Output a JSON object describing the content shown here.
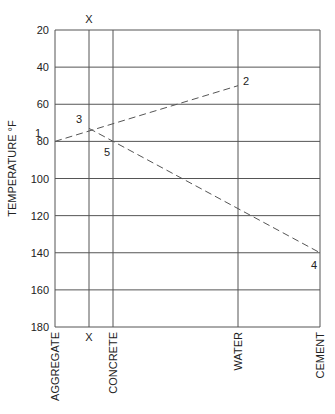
{
  "chart_data": {
    "type": "line",
    "title": "",
    "ylabel": "TEMPERATURE °F",
    "xlabel": "",
    "ylim": [
      20,
      180
    ],
    "y_inverted": true,
    "y_ticks": [
      20,
      40,
      60,
      80,
      100,
      120,
      140,
      160,
      180
    ],
    "x_positions": [
      {
        "label": "AGGREGATE",
        "x": 55
      },
      {
        "label": "X",
        "x": 89
      },
      {
        "label": "CONCRETE",
        "x": 113
      },
      {
        "label": "WATER",
        "x": 238
      },
      {
        "label": "CEMENT",
        "x": 320
      }
    ],
    "top_label": "X",
    "grid": true,
    "points": [
      {
        "id": "1",
        "at": "AGGREGATE",
        "temp": 80
      },
      {
        "id": "2",
        "at": "WATER",
        "temp": 50
      },
      {
        "id": "3",
        "at": "X",
        "temp": 73
      },
      {
        "id": "4",
        "at": "CEMENT",
        "temp": 140
      },
      {
        "id": "5",
        "at": "CONCRETE",
        "temp": 80
      }
    ],
    "series": [
      {
        "name": "line 1-2",
        "style": "dashed",
        "from": "1",
        "to": "2",
        "passes_through": "3"
      },
      {
        "name": "line 3-4",
        "style": "dashed",
        "from": "3",
        "to": "4",
        "passes_through": "5"
      }
    ]
  },
  "colors": {
    "line": "#555555",
    "grid": "#555555",
    "text": "#222222"
  }
}
